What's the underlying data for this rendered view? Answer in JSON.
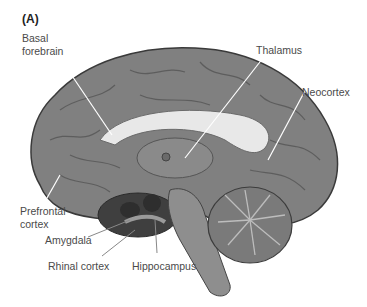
{
  "figure": {
    "panel_label": "(A)",
    "colors": {
      "cortex": "#7f7f7f",
      "cortex_dark": "#5e5e5e",
      "white_matter": "#e6e6e6",
      "deep_structures": "#3f3f3f",
      "leader_lines": "#ffffff",
      "label_text": "#4a4a4a"
    },
    "labels": {
      "basal_forebrain_1": "Basal",
      "basal_forebrain_2": "forebrain",
      "thalamus": "Thalamus",
      "neocortex": "Neocortex",
      "prefrontal_1": "Prefrontal",
      "prefrontal_2": "cortex",
      "amygdala": "Amygdala",
      "rhinal_cortex": "Rhinal cortex",
      "hippocampus": "Hippocampus"
    }
  }
}
